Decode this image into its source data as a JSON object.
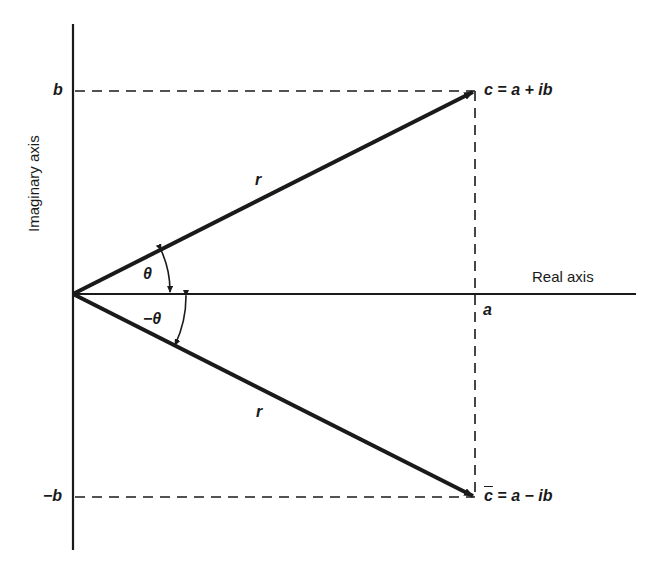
{
  "diagram": {
    "type": "complex-plane",
    "axes": {
      "x_label": "Real axis",
      "y_label": "Imaginary axis"
    },
    "ticks": {
      "b": "b",
      "neg_b": "−b",
      "a": "a"
    },
    "points": {
      "c": {
        "symbol": "c",
        "expr": " = a + ib"
      },
      "c_conj": {
        "symbol": "c",
        "expr": " = a − ib"
      }
    },
    "vectors": {
      "upper_r": "r",
      "lower_r": "r"
    },
    "angles": {
      "theta": "θ",
      "neg_theta": "−θ"
    },
    "colors": {
      "ink": "#1a1a1a",
      "background": "#ffffff"
    }
  }
}
